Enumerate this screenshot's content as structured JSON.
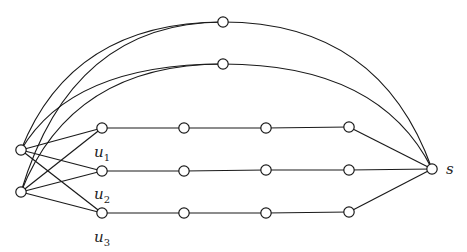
{
  "diagram": {
    "type": "graph",
    "vertices": [
      {
        "id": "a1",
        "label": ""
      },
      {
        "id": "a2",
        "label": ""
      },
      {
        "id": "t1",
        "label": ""
      },
      {
        "id": "t2",
        "label": ""
      },
      {
        "id": "u1",
        "label": "u",
        "sub": "1"
      },
      {
        "id": "r1b",
        "label": ""
      },
      {
        "id": "r1c",
        "label": ""
      },
      {
        "id": "r1d",
        "label": ""
      },
      {
        "id": "u2",
        "label": "u",
        "sub": "2"
      },
      {
        "id": "r2b",
        "label": ""
      },
      {
        "id": "r2c",
        "label": ""
      },
      {
        "id": "r2d",
        "label": ""
      },
      {
        "id": "u3",
        "label": "u",
        "sub": "3"
      },
      {
        "id": "r3b",
        "label": ""
      },
      {
        "id": "r3c",
        "label": ""
      },
      {
        "id": "r3d",
        "label": ""
      },
      {
        "id": "s",
        "label": "s"
      }
    ],
    "edges": [
      [
        "a1",
        "u1"
      ],
      [
        "a1",
        "u2"
      ],
      [
        "a1",
        "u3"
      ],
      [
        "a2",
        "u1"
      ],
      [
        "a2",
        "u2"
      ],
      [
        "a2",
        "u3"
      ],
      [
        "a1",
        "t1"
      ],
      [
        "a1",
        "t2"
      ],
      [
        "a2",
        "t1"
      ],
      [
        "a2",
        "t2"
      ],
      [
        "t1",
        "s"
      ],
      [
        "t2",
        "s"
      ],
      [
        "u1",
        "r1b"
      ],
      [
        "r1b",
        "r1c"
      ],
      [
        "r1c",
        "r1d"
      ],
      [
        "r1d",
        "s"
      ],
      [
        "u2",
        "r2b"
      ],
      [
        "r2b",
        "r2c"
      ],
      [
        "r2c",
        "r2d"
      ],
      [
        "r2d",
        "s"
      ],
      [
        "u3",
        "r3b"
      ],
      [
        "r3b",
        "r3c"
      ],
      [
        "r3c",
        "r3d"
      ],
      [
        "r3d",
        "s"
      ]
    ]
  }
}
